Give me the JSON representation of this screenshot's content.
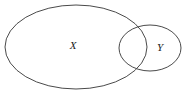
{
  "figure": {
    "type": "venn-diagram",
    "title": "",
    "background_color": "#ffffff",
    "stroke_color": "#4a4a4a",
    "label_color": "#1a1a1a",
    "width": 190,
    "height": 95,
    "relation": "partial-overlap"
  },
  "sets": [
    {
      "id": "set-x",
      "label": "X",
      "shape": "ellipse",
      "cx": 76,
      "cy": 47,
      "rx": 71,
      "ry": 42,
      "label_x": 73,
      "label_y": 46,
      "fill": "none"
    },
    {
      "id": "set-y",
      "label": "Y",
      "shape": "ellipse",
      "cx": 150,
      "cy": 48,
      "rx": 31,
      "ry": 23,
      "label_x": 160,
      "label_y": 48,
      "fill": "none"
    }
  ]
}
